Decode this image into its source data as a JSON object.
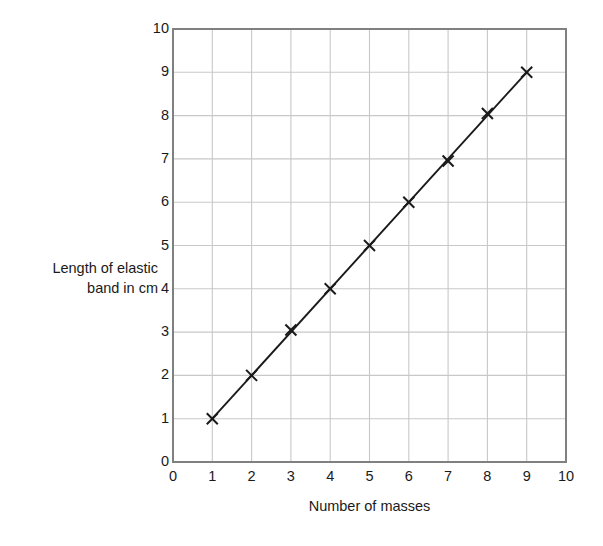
{
  "chart_data": {
    "type": "line",
    "title": "",
    "xlabel": "Number of masses",
    "ylabel": "Length of elastic\nband in cm",
    "xlim": [
      0,
      10
    ],
    "ylim": [
      0,
      10
    ],
    "xticks": [
      0,
      1,
      2,
      3,
      4,
      5,
      6,
      7,
      8,
      9,
      10
    ],
    "yticks": [
      0,
      1,
      2,
      3,
      4,
      5,
      6,
      7,
      8,
      9,
      10
    ],
    "grid": true,
    "legend": null,
    "marker": "x-cross",
    "line_color": "#1a1a1a",
    "grid_color": "#c8c8c8",
    "axis_color": "#808080",
    "x": [
      1,
      2,
      3,
      4,
      5,
      6,
      7,
      8,
      9
    ],
    "values": [
      1.0,
      2.0,
      3.05,
      4.0,
      5.0,
      6.0,
      6.95,
      8.05,
      9.0
    ],
    "series": [
      {
        "name": "Length of elastic band",
        "points": [
          {
            "x": 1,
            "y": 1.0
          },
          {
            "x": 2,
            "y": 2.0
          },
          {
            "x": 3,
            "y": 3.05
          },
          {
            "x": 4,
            "y": 4.0
          },
          {
            "x": 5,
            "y": 5.0
          },
          {
            "x": 6,
            "y": 6.0
          },
          {
            "x": 7,
            "y": 6.95
          },
          {
            "x": 8,
            "y": 8.05
          },
          {
            "x": 9,
            "y": 9.0
          }
        ]
      }
    ],
    "trend_line": {
      "from": {
        "x": 1,
        "y": 1.0
      },
      "to": {
        "x": 9,
        "y": 9.0
      }
    }
  }
}
